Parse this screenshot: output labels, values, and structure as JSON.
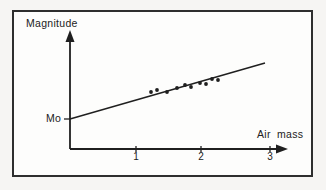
{
  "figure": {
    "y_axis_label": "Magnitude",
    "x_axis_label": "Air mass",
    "intercept_label": "Mo",
    "x_ticks": [
      "1",
      "2",
      "3"
    ],
    "ink_color": "#1f1f1f",
    "frame_border_color": "#2e2e2e",
    "background_color": "#f6f5f3",
    "panel_color": "#fdfdfc"
  },
  "chart_data": {
    "type": "scatter",
    "title": "",
    "xlabel": "Air mass",
    "ylabel": "Magnitude",
    "xlim": [
      0,
      3.3
    ],
    "x_tick_values": [
      1,
      2,
      3
    ],
    "y_axis_scale": "unlabeled (intercept marked Mo)",
    "y_intercept_label": "Mo",
    "legend": "none",
    "grid": false,
    "trend_line": {
      "air_mass_span": [
        0,
        2.95
      ],
      "intercept_at": "Mo",
      "px": [
        [
          70,
          119
        ],
        [
          265,
          63
        ]
      ]
    },
    "points": [
      {
        "air_mass": 1.23,
        "px": [
          151,
          92
        ]
      },
      {
        "air_mass": 1.32,
        "px": [
          157,
          90
        ]
      },
      {
        "air_mass": 1.47,
        "px": [
          167,
          92
        ]
      },
      {
        "air_mass": 1.62,
        "px": [
          177,
          88
        ]
      },
      {
        "air_mass": 1.74,
        "px": [
          185,
          85
        ]
      },
      {
        "air_mass": 1.83,
        "px": [
          191,
          87
        ]
      },
      {
        "air_mass": 1.97,
        "px": [
          200,
          83
        ]
      },
      {
        "air_mass": 2.06,
        "px": [
          206,
          84
        ]
      },
      {
        "air_mass": 2.15,
        "px": [
          212,
          79
        ]
      },
      {
        "air_mass": 2.24,
        "px": [
          218,
          80
        ]
      }
    ],
    "render_px": {
      "origin": {
        "x": 70,
        "y": 149
      },
      "y_axis": {
        "x": 70,
        "top": 41,
        "arrow_tip_y": 30,
        "arrow_half_w": 4.5,
        "arrow_len": 12
      },
      "x_axis": {
        "y": 149,
        "right": 277,
        "arrow_tip_x": 288,
        "arrow_half_h": 4.5,
        "arrow_len": 12
      },
      "x_tick_px": [
        136,
        201,
        270
      ],
      "tick_half_len": 3,
      "mo_tick": {
        "y": 119,
        "x1": 64,
        "x2": 70
      },
      "point_radius": 1.9,
      "axis_stroke_width": 1.8,
      "line_stroke_width": 1.5
    }
  }
}
